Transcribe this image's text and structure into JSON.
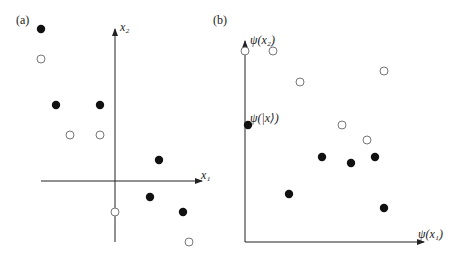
{
  "panel_a": {
    "label": "(a)",
    "x_axis_label": "x₁",
    "y_axis_label": "x₂",
    "points": [
      {
        "x": 41,
        "y": 29,
        "filled": true
      },
      {
        "x": 41,
        "y": 59,
        "filled": false
      },
      {
        "x": 56,
        "y": 105,
        "filled": true
      },
      {
        "x": 100,
        "y": 105,
        "filled": true
      },
      {
        "x": 70,
        "y": 135,
        "filled": false
      },
      {
        "x": 100,
        "y": 135,
        "filled": false
      },
      {
        "x": 159,
        "y": 160,
        "filled": true
      },
      {
        "x": 150,
        "y": 197,
        "filled": true
      },
      {
        "x": 183,
        "y": 212,
        "filled": true
      },
      {
        "x": 115,
        "y": 212,
        "filled": false
      },
      {
        "x": 189,
        "y": 242,
        "filled": false
      }
    ]
  },
  "panel_b": {
    "label": "(b)",
    "x_axis_label": "ψ(x₁)",
    "y_axis_label": "ψ(x₂)",
    "point_annotation": "ψ(|x⟩)",
    "points": [
      {
        "x": 245,
        "y": 51,
        "filled": false
      },
      {
        "x": 273,
        "y": 51,
        "filled": false
      },
      {
        "x": 300,
        "y": 82,
        "filled": false
      },
      {
        "x": 384,
        "y": 71,
        "filled": false
      },
      {
        "x": 248,
        "y": 125,
        "filled": true
      },
      {
        "x": 342,
        "y": 125,
        "filled": false
      },
      {
        "x": 367,
        "y": 140,
        "filled": false
      },
      {
        "x": 322,
        "y": 157,
        "filled": true
      },
      {
        "x": 351,
        "y": 163,
        "filled": true
      },
      {
        "x": 375,
        "y": 157,
        "filled": true
      },
      {
        "x": 289,
        "y": 194,
        "filled": true
      },
      {
        "x": 384,
        "y": 208,
        "filled": true
      }
    ]
  },
  "colors": {
    "filled_point": "#111111",
    "open_point_stroke": "#777777",
    "axis": "#222222"
  }
}
